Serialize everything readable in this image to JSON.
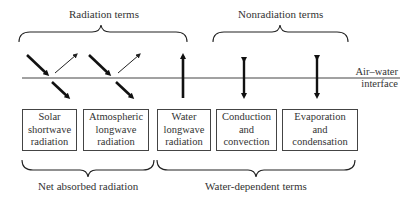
{
  "top_groups": [
    {
      "label": "Radiation terms"
    },
    {
      "label": "Nonradiation terms"
    }
  ],
  "interface": {
    "line1": "Air–water",
    "line2": "interface"
  },
  "boxes": [
    {
      "lines": [
        "Solar",
        "shortwave",
        "radiation"
      ]
    },
    {
      "lines": [
        "Atmospheric",
        "longwave",
        "radiation"
      ]
    },
    {
      "lines": [
        "Water",
        "longwave",
        "radiation"
      ]
    },
    {
      "lines": [
        "Conduction",
        "and",
        "convection"
      ]
    },
    {
      "lines": [
        "Evaporation",
        "and",
        "condensation"
      ]
    }
  ],
  "bottom_groups": [
    {
      "label": "Net absorbed radiation"
    },
    {
      "label": "Water-dependent terms"
    }
  ],
  "colors": {
    "stroke": "#1a1a1a",
    "text": "#333333",
    "background": "#ffffff"
  }
}
